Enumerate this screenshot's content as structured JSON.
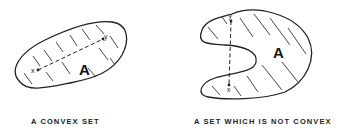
{
  "figures": [
    {
      "id": "convex",
      "set_label": "A",
      "point_start": "x",
      "point_end": "y",
      "caption": "A CONVEX SET"
    },
    {
      "id": "non-convex",
      "set_label": "A",
      "point_start": "y",
      "point_end": "x",
      "caption": "A SET WHICH IS NOT CONVEX"
    }
  ]
}
